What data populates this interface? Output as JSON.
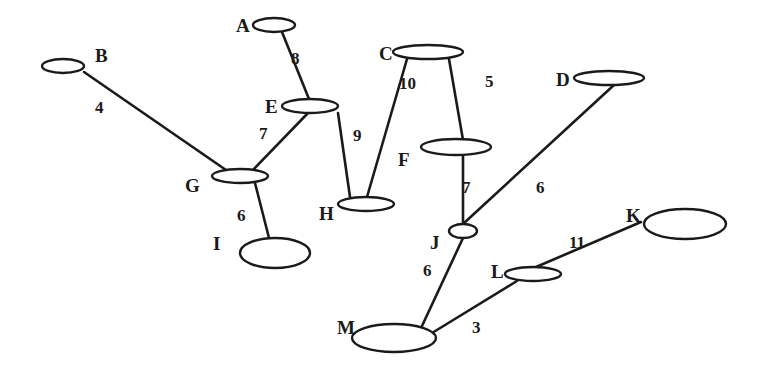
{
  "diagram": {
    "type": "weighted-undirected-graph",
    "colors": {
      "stroke": "#1a1a1a",
      "background": "#ffffff",
      "node_fill": "#ffffff"
    },
    "nodes": [
      {
        "id": "A",
        "label": "A",
        "cx": 274,
        "cy": 25,
        "rx": 21,
        "ry": 7,
        "lx": 236,
        "ly": 32
      },
      {
        "id": "B",
        "label": "B",
        "cx": 63,
        "cy": 66,
        "rx": 21,
        "ry": 7,
        "lx": 95,
        "ly": 62
      },
      {
        "id": "C",
        "label": "C",
        "cx": 428,
        "cy": 52,
        "rx": 35,
        "ry": 7,
        "lx": 379,
        "ly": 60
      },
      {
        "id": "D",
        "label": "D",
        "cx": 609,
        "cy": 78,
        "rx": 35,
        "ry": 7,
        "lx": 556,
        "ly": 86
      },
      {
        "id": "E",
        "label": "E",
        "cx": 310,
        "cy": 106,
        "rx": 28,
        "ry": 7,
        "lx": 265,
        "ly": 113
      },
      {
        "id": "F",
        "label": "F",
        "cx": 456,
        "cy": 147,
        "rx": 35,
        "ry": 8,
        "lx": 398,
        "ly": 166
      },
      {
        "id": "G",
        "label": "G",
        "cx": 240,
        "cy": 176,
        "rx": 28,
        "ry": 7,
        "lx": 185,
        "ly": 192
      },
      {
        "id": "H",
        "label": "H",
        "cx": 366,
        "cy": 204,
        "rx": 28,
        "ry": 7,
        "lx": 319,
        "ly": 220
      },
      {
        "id": "I",
        "label": "I",
        "cx": 275,
        "cy": 253,
        "rx": 35,
        "ry": 15,
        "lx": 213,
        "ly": 250
      },
      {
        "id": "J",
        "label": "J",
        "cx": 463,
        "cy": 231,
        "rx": 14,
        "ry": 7,
        "lx": 430,
        "ly": 249
      },
      {
        "id": "K",
        "label": "K",
        "cx": 685,
        "cy": 224,
        "rx": 41,
        "ry": 15,
        "lx": 626,
        "ly": 222
      },
      {
        "id": "L",
        "label": "L",
        "cx": 533,
        "cy": 274,
        "rx": 28,
        "ry": 7,
        "lx": 491,
        "ly": 278
      },
      {
        "id": "M",
        "label": "M",
        "cx": 394,
        "cy": 338,
        "rx": 42,
        "ry": 14,
        "lx": 337,
        "ly": 334
      }
    ],
    "edges": [
      {
        "from": "B",
        "to": "G",
        "weight": "4",
        "x1": 84,
        "y1": 72,
        "x2": 226,
        "y2": 170,
        "wx": 95,
        "wy": 113
      },
      {
        "from": "A",
        "to": "E",
        "weight": "8",
        "x1": 282,
        "y1": 32,
        "x2": 309,
        "y2": 99,
        "wx": 291,
        "wy": 64
      },
      {
        "from": "E",
        "to": "G",
        "weight": "7",
        "x1": 308,
        "y1": 113,
        "x2": 253,
        "y2": 170,
        "wx": 259,
        "wy": 139
      },
      {
        "from": "E",
        "to": "H",
        "weight": "9",
        "x1": 338,
        "y1": 113,
        "x2": 350,
        "y2": 197,
        "wx": 353,
        "wy": 141
      },
      {
        "from": "C",
        "to": "H",
        "weight": "10",
        "x1": 407,
        "y1": 59,
        "x2": 367,
        "y2": 197,
        "wx": 399,
        "wy": 89
      },
      {
        "from": "C",
        "to": "F",
        "weight": "5",
        "x1": 449,
        "y1": 59,
        "x2": 463,
        "y2": 140,
        "wx": 485,
        "wy": 87
      },
      {
        "from": "F",
        "to": "J",
        "weight": "7",
        "x1": 463,
        "y1": 155,
        "x2": 463,
        "y2": 224,
        "wx": 462,
        "wy": 193
      },
      {
        "from": "D",
        "to": "J",
        "weight": "6",
        "x1": 614,
        "y1": 85,
        "x2": 463,
        "y2": 224,
        "wx": 536,
        "wy": 193
      },
      {
        "from": "G",
        "to": "I",
        "weight": "6",
        "x1": 255,
        "y1": 183,
        "x2": 269,
        "y2": 238,
        "wx": 237,
        "wy": 221
      },
      {
        "from": "J",
        "to": "M",
        "weight": "6",
        "x1": 463,
        "y1": 238,
        "x2": 422,
        "y2": 326,
        "wx": 423,
        "wy": 276
      },
      {
        "from": "L",
        "to": "K",
        "weight": "11",
        "x1": 536,
        "y1": 267,
        "x2": 641,
        "y2": 222,
        "wx": 569,
        "wy": 248
      },
      {
        "from": "L",
        "to": "M",
        "weight": "3",
        "x1": 517,
        "y1": 281,
        "x2": 432,
        "y2": 333,
        "wx": 472,
        "wy": 333
      }
    ]
  }
}
